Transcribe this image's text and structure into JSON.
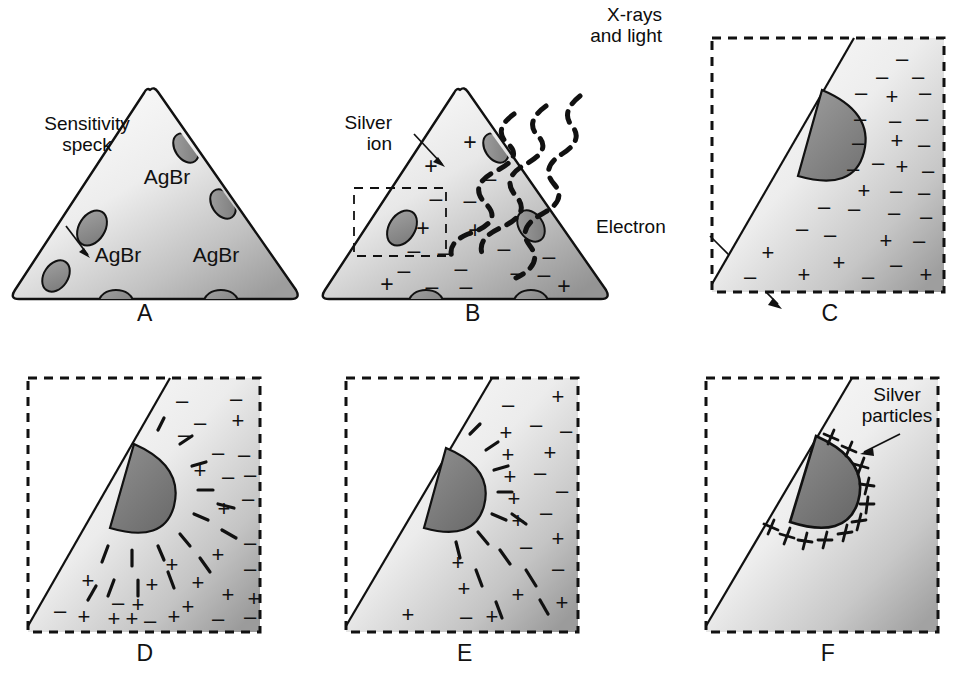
{
  "figure": {
    "background": "#ffffff",
    "ink": "#111111",
    "crystal_fill_light": "#f2f2f2",
    "crystal_fill_dark": "#9a9a9a",
    "speck_fill": "#8d8d8d",
    "speck_stroke": "#111111"
  },
  "labels": {
    "sensitivity_speck": "Sensitivity\nspeck",
    "xrays_and_light": "X-rays\nand light",
    "silver_ion": "Silver\nion",
    "electron": "Electron",
    "silver_particles": "Silver\nparticles",
    "agbr": "AgBr"
  },
  "panels": [
    {
      "id": "A",
      "letter": "A",
      "kind": "whole-crystal",
      "caption_text": "AgBr crystal with sensitivity specks",
      "crystal_labels": [
        "AgBr",
        "AgBr",
        "AgBr"
      ],
      "speck_count": 6,
      "charges": []
    },
    {
      "id": "B",
      "letter": "B",
      "kind": "whole-crystal-irradiated",
      "caption_text": "X-rays and light strike the crystal liberating electrons",
      "crystal_labels": [],
      "speck_count": 5,
      "charges": [
        "+",
        "+",
        "-",
        "-",
        "+",
        "+",
        "-",
        "-",
        "-",
        "+",
        "-",
        "+",
        "-",
        "-",
        "-",
        "+",
        "-",
        "-",
        "+"
      ],
      "ray_count": 3,
      "inset_box": true
    },
    {
      "id": "C",
      "letter": "C",
      "kind": "magnified",
      "caption_text": "Magnified corner: free electrons and silver ions",
      "charges": [
        "-",
        "-",
        "-",
        "-",
        "-",
        "+",
        "-",
        "-",
        "-",
        "-",
        "-",
        "+",
        "-",
        "-",
        "+",
        "-",
        "+",
        "-",
        "-",
        "-",
        "-",
        "-",
        "-",
        "+",
        "-",
        "+",
        "-",
        "+",
        "-",
        "+",
        "-",
        "+"
      ],
      "radiating": "none"
    },
    {
      "id": "D",
      "letter": "D",
      "kind": "magnified",
      "caption_text": "Electrons migrate to the sensitivity speck",
      "charges": [
        "-",
        "-",
        "-",
        "+",
        "-",
        "-",
        "-",
        "+",
        "-",
        "+",
        "+",
        "-",
        "+",
        "+",
        "+",
        "+",
        "+",
        "-",
        "+",
        "-",
        "+",
        "+",
        "+",
        "+",
        "-",
        "+",
        "-",
        "-"
      ],
      "radiating": "minus"
    },
    {
      "id": "E",
      "letter": "E",
      "kind": "magnified",
      "caption_text": "Silver ions are attracted to the negatively charged speck",
      "charges": [
        "-",
        "+",
        "-",
        "+",
        "-",
        "+",
        "+",
        "-",
        "+",
        "+",
        "-",
        "+",
        "-",
        "-",
        "+",
        "-",
        "+",
        "-",
        "+",
        "+",
        "+",
        "+",
        "+"
      ],
      "radiating": "plus"
    },
    {
      "id": "F",
      "letter": "F",
      "kind": "magnified-final",
      "caption_text": "Silver ions neutralized forming silver particles at the speck",
      "charges": [],
      "radiating": "none",
      "particle_count": 11
    }
  ]
}
